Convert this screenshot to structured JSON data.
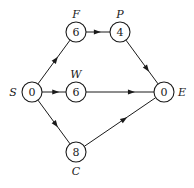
{
  "diagram": {
    "type": "activity-network",
    "nodes": [
      {
        "id": "S",
        "label": "S",
        "value": "0"
      },
      {
        "id": "F",
        "label": "F",
        "value": "6"
      },
      {
        "id": "P",
        "label": "P",
        "value": "4"
      },
      {
        "id": "W",
        "label": "W",
        "value": "6"
      },
      {
        "id": "C",
        "label": "C",
        "value": "8"
      },
      {
        "id": "E",
        "label": "E",
        "value": "0"
      }
    ],
    "edges": [
      {
        "from": "S",
        "to": "F"
      },
      {
        "from": "S",
        "to": "W"
      },
      {
        "from": "S",
        "to": "C"
      },
      {
        "from": "F",
        "to": "P"
      },
      {
        "from": "P",
        "to": "E"
      },
      {
        "from": "W",
        "to": "E"
      },
      {
        "from": "C",
        "to": "E"
      }
    ]
  }
}
